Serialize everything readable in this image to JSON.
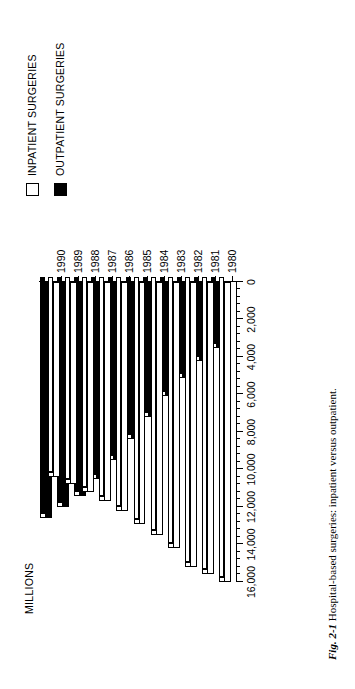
{
  "figure": {
    "caption_label": "Fig. 2-1",
    "caption_text": "Hospital-based surgeries: inpatient versus outpatient."
  },
  "legend": {
    "items": [
      {
        "label": "INPATIENT SURGERIES",
        "swatch": "white",
        "color": "#ffffff"
      },
      {
        "label": "OUTPATIENT SURGERIES",
        "swatch": "black",
        "color": "#000000"
      }
    ]
  },
  "chart_data": {
    "type": "bar",
    "orientation": "horizontal",
    "title": "",
    "xlabel": "",
    "ylabel": "MILLIONS",
    "axis_title": "MILLIONS",
    "categories": [
      "1980",
      "1981",
      "1982",
      "1983",
      "1984",
      "1985",
      "1986",
      "1987",
      "1988",
      "1989",
      "1990"
    ],
    "value_ticks": [
      "0",
      "2,000",
      "4,000",
      "6,000",
      "8,000",
      "10,000",
      "12,000",
      "14,000",
      "16,000"
    ],
    "value_tick_numbers": [
      0,
      2000,
      4000,
      6000,
      8000,
      10000,
      12000,
      14000,
      16000
    ],
    "ylim": [
      0,
      16000
    ],
    "minor_ticks_per_interval": 4,
    "grid": false,
    "legend_position": "top-left",
    "series": [
      {
        "name": "INPATIENT SURGERIES",
        "color": "#ffffff",
        "values": [
          16000,
          15600,
          15200,
          14200,
          13500,
          12900,
          12200,
          11700,
          11200,
          10800,
          10400
        ]
      },
      {
        "name": "OUTPATIENT SURGERIES",
        "color": "#000000",
        "values": [
          3500,
          4200,
          5100,
          6100,
          7200,
          8400,
          9500,
          10500,
          11400,
          12000,
          12600
        ]
      }
    ]
  }
}
